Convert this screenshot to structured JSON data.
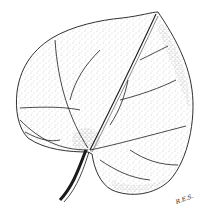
{
  "illustration": {
    "subject": "leaf",
    "style": "stippled pen-and-ink",
    "ink_color": "#1a1a1a",
    "background_color": "#ffffff"
  },
  "signature": "R.E.S."
}
